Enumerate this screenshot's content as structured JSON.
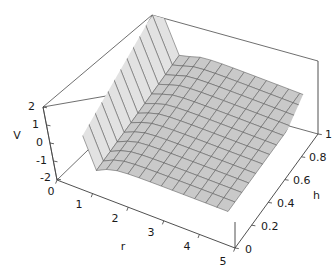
{
  "chart_data": {
    "type": "surface",
    "title": "",
    "xlabel": "r",
    "ylabel": "h",
    "zlabel": "V",
    "xlim": [
      0,
      5
    ],
    "ylim": [
      0,
      1
    ],
    "zlim": [
      -2,
      2
    ],
    "grid": true,
    "legend": "none",
    "projection": "3d-axonometric",
    "surface_style": {
      "fill": "#c9c9c9",
      "mesh_line": "#5a5a5a",
      "shading": "flat-gray"
    },
    "frame_color": "#3c3c3c",
    "background": "#ffffff",
    "x_ticks": [
      "0",
      "1",
      "2",
      "3",
      "4",
      "5"
    ],
    "x_tick_values": [
      0,
      1,
      2,
      3,
      4,
      5
    ],
    "y_ticks": [
      "0",
      "0.2",
      "0.4",
      "0.6",
      "0.8",
      "1"
    ],
    "y_tick_values": [
      0,
      0.2,
      0.4,
      0.6,
      0.8,
      1
    ],
    "z_ticks": [
      "-2",
      "-1",
      "0",
      "1",
      "2"
    ],
    "z_tick_values": [
      -2,
      -1,
      0,
      1,
      2
    ],
    "mesh_nx": 16,
    "mesh_ny": 12,
    "surface_values_note": "V clipped to [-2,2]; sharp positive divergence at small r, shallow negative well near r=1, asymptotic to 0",
    "sample_r": [
      0.3,
      0.5,
      0.8,
      1.0,
      1.5,
      2.0,
      2.5,
      3.0,
      3.5,
      4.0,
      4.5,
      5.0
    ],
    "sample_V_at_h_1": [
      2.0,
      2.0,
      0.2,
      -0.35,
      -0.5,
      -0.42,
      -0.33,
      -0.26,
      -0.2,
      -0.16,
      -0.13,
      -0.1
    ],
    "sample_V_at_h_0": [
      2.0,
      2.0,
      0.15,
      -0.4,
      -0.55,
      -0.46,
      -0.36,
      -0.28,
      -0.22,
      -0.17,
      -0.14,
      -0.11
    ]
  },
  "axes": {
    "x": {
      "title": "r",
      "ticks": [
        "0",
        "1",
        "2",
        "3",
        "4",
        "5"
      ]
    },
    "y": {
      "title": "h",
      "ticks": [
        "0",
        "0.2",
        "0.4",
        "0.6",
        "0.8",
        "1"
      ]
    },
    "z": {
      "title": "V",
      "ticks": [
        "2",
        "1",
        "0",
        "-1",
        "-2"
      ]
    }
  },
  "labels": {
    "z_2": "2",
    "z_1": "1",
    "z_0": "0",
    "z_m1": "-1",
    "z_m2": "-2",
    "z_title": "V",
    "x_0": "0",
    "x_1": "1",
    "x_2": "2",
    "x_3": "3",
    "x_4": "4",
    "x_5": "5",
    "x_title": "r",
    "y_0": "0",
    "y_02": "0.2",
    "y_04": "0.4",
    "y_06": "0.6",
    "y_08": "0.8",
    "y_1": "1",
    "y_title": "h"
  }
}
